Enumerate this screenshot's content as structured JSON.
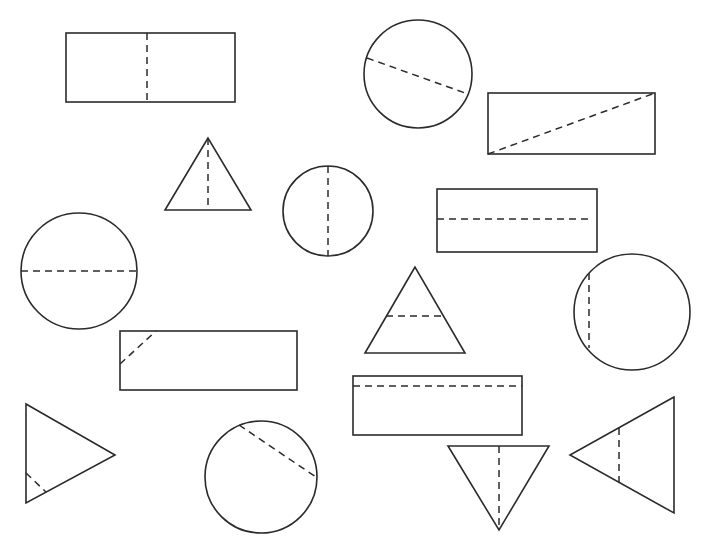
{
  "diagram": {
    "stroke_color": "#2b2b2b",
    "background": "#ffffff",
    "shapes": [
      {
        "id": "rect-1",
        "type": "rectangle",
        "x": 66,
        "y": 33,
        "w": 169,
        "h": 69,
        "line": {
          "x1": 147,
          "y1": 33,
          "x2": 147,
          "y2": 102
        },
        "line_kind": "vertical-center"
      },
      {
        "id": "circle-1",
        "type": "circle",
        "cx": 418,
        "cy": 74,
        "r": 54,
        "line": {
          "x1": 367,
          "y1": 58,
          "x2": 468,
          "y2": 94
        },
        "line_kind": "diameter-diagonal"
      },
      {
        "id": "rect-2",
        "type": "rectangle",
        "x": 488,
        "y": 93,
        "w": 167,
        "h": 61,
        "line": {
          "x1": 488,
          "y1": 154,
          "x2": 655,
          "y2": 93
        },
        "line_kind": "diagonal"
      },
      {
        "id": "triangle-1",
        "type": "triangle",
        "points": [
          [
            208,
            138
          ],
          [
            165,
            210
          ],
          [
            251,
            210
          ]
        ],
        "line": {
          "x1": 208,
          "y1": 138,
          "x2": 208,
          "y2": 210
        },
        "line_kind": "vertical-altitude"
      },
      {
        "id": "circle-2",
        "type": "circle",
        "cx": 328,
        "cy": 211,
        "r": 45,
        "line": {
          "x1": 328,
          "y1": 166,
          "x2": 328,
          "y2": 256
        },
        "line_kind": "diameter-vertical"
      },
      {
        "id": "rect-3",
        "type": "rectangle",
        "x": 437,
        "y": 189,
        "w": 160,
        "h": 63,
        "line": {
          "x1": 437,
          "y1": 219,
          "x2": 593,
          "y2": 219
        },
        "line_kind": "horizontal-center"
      },
      {
        "id": "circle-3",
        "type": "circle",
        "cx": 79,
        "cy": 271,
        "r": 58,
        "line": {
          "x1": 21,
          "y1": 271,
          "x2": 137,
          "y2": 271
        },
        "line_kind": "diameter-horizontal"
      },
      {
        "id": "triangle-2",
        "type": "triangle",
        "points": [
          [
            415,
            267
          ],
          [
            365,
            353
          ],
          [
            465,
            353
          ]
        ],
        "line": {
          "x1": 386,
          "y1": 316,
          "x2": 443,
          "y2": 316
        },
        "line_kind": "horizontal-non-symmetric"
      },
      {
        "id": "circle-4",
        "type": "circle",
        "cx": 632,
        "cy": 312,
        "r": 58,
        "line": {
          "x1": 589,
          "y1": 273,
          "x2": 589,
          "y2": 348
        },
        "line_kind": "chord-vertical"
      },
      {
        "id": "rect-4",
        "type": "rectangle",
        "x": 120,
        "y": 331,
        "w": 177,
        "h": 59,
        "line": {
          "x1": 120,
          "y1": 364,
          "x2": 156,
          "y2": 331
        },
        "line_kind": "corner-diagonal"
      },
      {
        "id": "rect-5",
        "type": "rectangle",
        "x": 353,
        "y": 376,
        "w": 169,
        "h": 59,
        "line": {
          "x1": 353,
          "y1": 386,
          "x2": 522,
          "y2": 386
        },
        "line_kind": "horizontal-off-center"
      },
      {
        "id": "triangle-3",
        "type": "triangle",
        "points": [
          [
            26,
            404
          ],
          [
            115,
            455
          ],
          [
            26,
            503
          ]
        ],
        "line": {
          "x1": 26,
          "y1": 473,
          "x2": 46,
          "y2": 492
        },
        "line_kind": "corner-segment"
      },
      {
        "id": "circle-5",
        "type": "circle",
        "cx": 261,
        "cy": 477,
        "r": 56,
        "line": {
          "x1": 239,
          "y1": 425,
          "x2": 316,
          "y2": 477
        },
        "line_kind": "chord-diagonal"
      },
      {
        "id": "triangle-4",
        "type": "triangle",
        "points": [
          [
            448,
            446
          ],
          [
            549,
            446
          ],
          [
            499,
            530
          ]
        ],
        "line": {
          "x1": 499,
          "y1": 446,
          "x2": 499,
          "y2": 530
        },
        "line_kind": "vertical-altitude"
      },
      {
        "id": "triangle-5",
        "type": "triangle",
        "points": [
          [
            674,
            397
          ],
          [
            570,
            455
          ],
          [
            674,
            513
          ]
        ],
        "line": {
          "x1": 619,
          "y1": 428,
          "x2": 619,
          "y2": 483
        },
        "line_kind": "vertical-non-symmetric"
      }
    ]
  }
}
